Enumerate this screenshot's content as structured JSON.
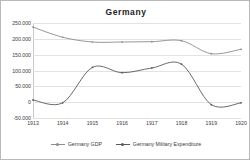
{
  "chart_data": {
    "type": "line",
    "title": "Germany",
    "xlabel": "",
    "ylabel": "",
    "categories": [
      "1913",
      "1914",
      "1915",
      "1916",
      "1917",
      "1918",
      "1919",
      "1920"
    ],
    "ylim": [
      -50000,
      250000
    ],
    "yticks": [
      250000,
      200000,
      150000,
      100000,
      50000,
      0,
      -50000
    ],
    "ytick_labels": [
      "250.000",
      "200.000",
      "150.000",
      "100.000",
      "50.000",
      "0",
      "-50.000"
    ],
    "grid": true,
    "legend_position": "bottom",
    "series": [
      {
        "name": "Germany GDP",
        "color": "#8c8c8c",
        "values": [
          237000,
          205000,
          190000,
          190000,
          191000,
          194000,
          153000,
          167000
        ]
      },
      {
        "name": "Germany Military Expenditure",
        "color": "#5a5a5a",
        "values": [
          7000,
          -2000,
          110000,
          93000,
          108000,
          120000,
          -8000,
          -2000
        ]
      }
    ]
  },
  "legend": {
    "items": [
      {
        "label": "Germany GDP",
        "icon": "line-marker-icon"
      },
      {
        "label": "Germany Military Expenditure",
        "icon": "line-marker-icon"
      }
    ]
  },
  "colors": {
    "gdp": "#8c8c8c",
    "military": "#5a5a5a",
    "gridline": "#e2e2e2",
    "axis": "#c9c9c9",
    "text": "#3a3a3a",
    "border": "#b9b9b9",
    "background": "#ffffff"
  }
}
